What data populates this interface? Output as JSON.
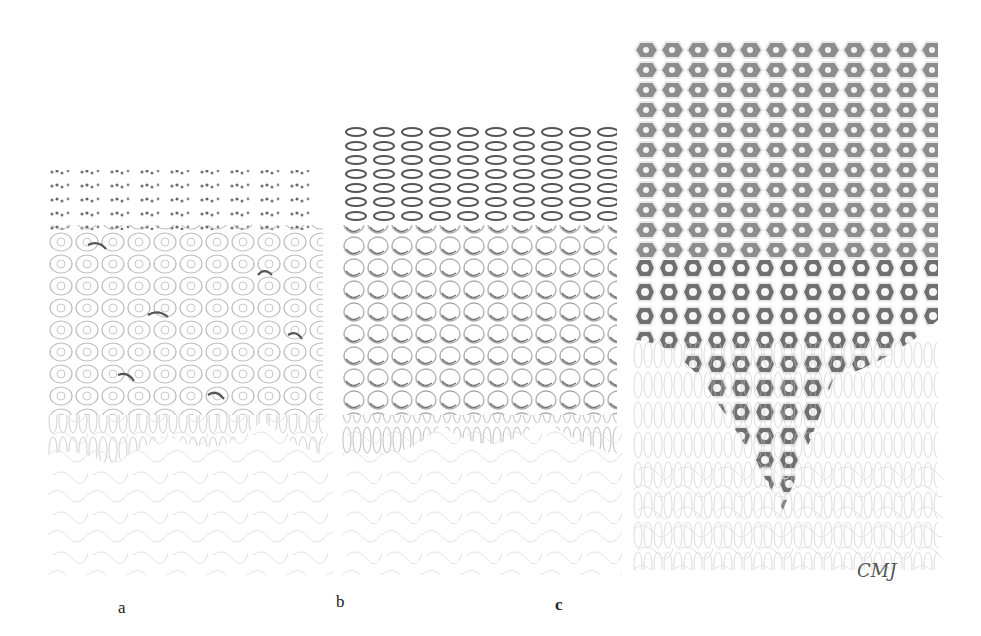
{
  "figure": {
    "panels": [
      {
        "id": "a",
        "label": "a",
        "description": "epithelium with granular upper layers and scattered dark-rimmed cells"
      },
      {
        "id": "b",
        "label": "b",
        "description": "epithelium with darker granular upper layers and more dark-rimmed rounded cells"
      },
      {
        "id": "c",
        "label": "c",
        "description": "thickened epithelium with densely stained polygonal cells and pale nuclei"
      }
    ],
    "signature": "CMJ",
    "colors": {
      "background": "#ffffff",
      "light_cell_outline": "#b8b8b8",
      "dark_granules": "#555555",
      "dense_cell_fill": "#8a8a8a",
      "nucleus": "#f4f4f4",
      "connective_tissue": "#d8d8d8"
    }
  }
}
